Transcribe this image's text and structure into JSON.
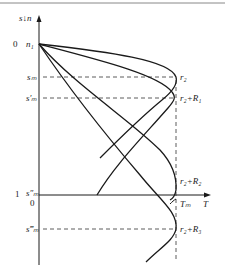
{
  "diagram": {
    "colors": {
      "stroke": "#1a1a1a",
      "dash": "#333333",
      "border": "#888888"
    },
    "axis_label_vertical": "s↓n",
    "axis_label_horizontal": "T",
    "origin_top_value": "0",
    "origin_top_label": "n₁",
    "one_value": "1",
    "origin_bottom_value": "0",
    "levels": {
      "s_m": "sₘ",
      "s_m_prime": "s′ₘ",
      "s_m_double": "s″ₘ",
      "s_m_triple": "s‴ₘ"
    },
    "right_labels": {
      "r2": "r₂",
      "r2_R1": "r₂+R₁",
      "r2_R2": "r₂+R₂",
      "r2_R3": "r₂+R₃",
      "T_m": "Tₘ"
    }
  }
}
